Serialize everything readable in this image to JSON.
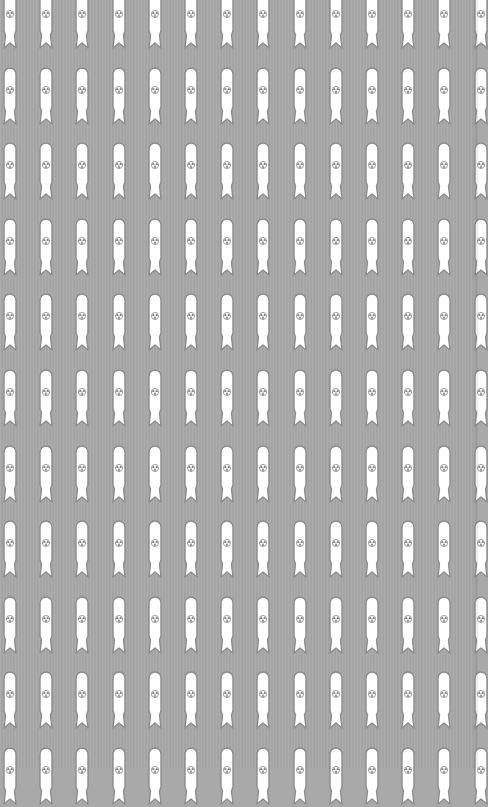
{
  "pattern": {
    "name": "bomb-wallpaper",
    "motif": "bomb-with-radiation-symbol",
    "symbol_icon": "radiation-icon",
    "rows": 11,
    "columns": 14,
    "colors": {
      "background": "#a9a9a9",
      "bomb_fill": "#ffffff",
      "bomb_outline": "#8c8c8c",
      "symbol": "#8c8c8c"
    }
  }
}
